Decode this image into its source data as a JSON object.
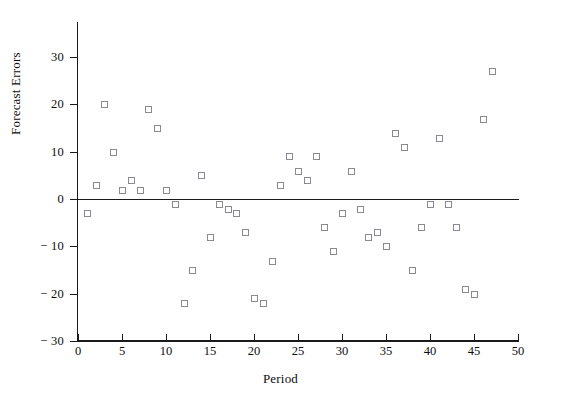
{
  "chart_data": {
    "type": "scatter",
    "title": "",
    "xlabel": "Period",
    "ylabel": "Forecast Errors",
    "xlim": [
      0,
      50
    ],
    "ylim": [
      -30,
      30
    ],
    "grid": false,
    "legend": null,
    "xticks": [
      0,
      5,
      10,
      15,
      20,
      25,
      30,
      35,
      40,
      45,
      50
    ],
    "xtick_labels": [
      "0",
      "5",
      "10",
      "15",
      "20",
      "25",
      "30",
      "35",
      "40",
      "45",
      "50"
    ],
    "yticks": [
      30,
      20,
      10,
      0,
      -10,
      -20,
      -30
    ],
    "ytick_labels": [
      "30",
      "20",
      "10",
      "0",
      "− 10",
      "− 20",
      "− 30"
    ],
    "reference_line": {
      "y": 0,
      "style": "solid",
      "color": "#1a1a1a"
    },
    "marker": {
      "shape": "square-open",
      "edge_color": "#8a8a92",
      "size_px": 5
    },
    "x": [
      1,
      2,
      3,
      4,
      5,
      6,
      7,
      8,
      9,
      10,
      11,
      12,
      13,
      14,
      15,
      16,
      17,
      18,
      19,
      20,
      21,
      22,
      23,
      24,
      25,
      26,
      27,
      28,
      29,
      30,
      31,
      32,
      33,
      34,
      35,
      36,
      37,
      38,
      39,
      40,
      41,
      42,
      43,
      44,
      45,
      46,
      47
    ],
    "y": [
      -3,
      3,
      20,
      10,
      2,
      4,
      2,
      19,
      15,
      2,
      -1,
      -22,
      -15,
      5,
      -8,
      -1,
      -2,
      -3,
      -7,
      -21,
      -22,
      -13,
      3,
      9,
      6,
      4,
      9,
      -6,
      -11,
      -3,
      6,
      -2,
      -8,
      -7,
      -10,
      14,
      11,
      -15,
      -6,
      -1,
      13,
      -1,
      -6,
      -19,
      -20,
      17,
      27
    ],
    "points": [
      {
        "x": 1,
        "y": -3
      },
      {
        "x": 2,
        "y": 3
      },
      {
        "x": 3,
        "y": 20
      },
      {
        "x": 4,
        "y": 10
      },
      {
        "x": 5,
        "y": 2
      },
      {
        "x": 6,
        "y": 4
      },
      {
        "x": 7,
        "y": 2
      },
      {
        "x": 8,
        "y": 19
      },
      {
        "x": 9,
        "y": 15
      },
      {
        "x": 10,
        "y": 2
      },
      {
        "x": 11,
        "y": -1
      },
      {
        "x": 12,
        "y": -22
      },
      {
        "x": 13,
        "y": -15
      },
      {
        "x": 14,
        "y": 5
      },
      {
        "x": 15,
        "y": -8
      },
      {
        "x": 16,
        "y": -1
      },
      {
        "x": 17,
        "y": -2
      },
      {
        "x": 18,
        "y": -3
      },
      {
        "x": 19,
        "y": -7
      },
      {
        "x": 20,
        "y": -21
      },
      {
        "x": 21,
        "y": -22
      },
      {
        "x": 22,
        "y": -13
      },
      {
        "x": 23,
        "y": 3
      },
      {
        "x": 24,
        "y": 9
      },
      {
        "x": 25,
        "y": 6
      },
      {
        "x": 26,
        "y": 4
      },
      {
        "x": 27,
        "y": 9
      },
      {
        "x": 28,
        "y": -6
      },
      {
        "x": 29,
        "y": -11
      },
      {
        "x": 30,
        "y": -3
      },
      {
        "x": 31,
        "y": 6
      },
      {
        "x": 32,
        "y": -2
      },
      {
        "x": 33,
        "y": -8
      },
      {
        "x": 34,
        "y": -7
      },
      {
        "x": 35,
        "y": -10
      },
      {
        "x": 36,
        "y": 14
      },
      {
        "x": 37,
        "y": 11
      },
      {
        "x": 38,
        "y": -15
      },
      {
        "x": 39,
        "y": -6
      },
      {
        "x": 40,
        "y": -1
      },
      {
        "x": 41,
        "y": 13
      },
      {
        "x": 42,
        "y": -1
      },
      {
        "x": 43,
        "y": -6
      },
      {
        "x": 44,
        "y": -19
      },
      {
        "x": 45,
        "y": -20
      },
      {
        "x": 46,
        "y": 17
      },
      {
        "x": 47,
        "y": 27
      }
    ]
  },
  "colors": {
    "axis": "#1a1a1a",
    "marker_edge": "#8a8a92",
    "text": "#0d0d0d",
    "background": "#ffffff"
  }
}
